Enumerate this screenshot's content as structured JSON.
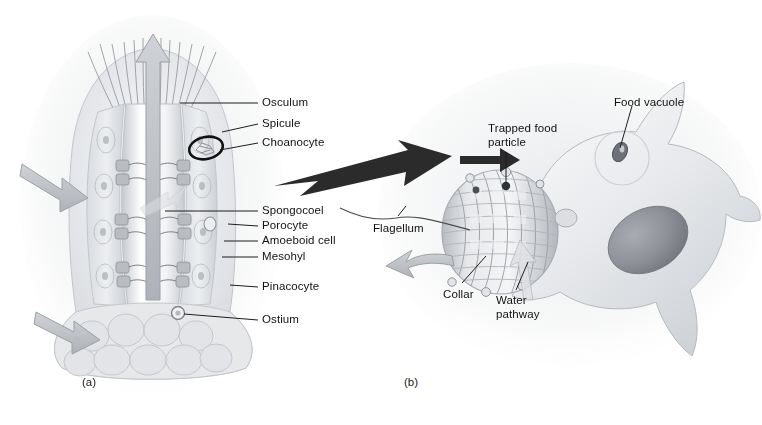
{
  "figure": {
    "background": "#ffffff",
    "ink": "#111111"
  },
  "panel_a": {
    "caption": "(a)",
    "caption_pos": {
      "x": 82,
      "y": 383
    },
    "labels": [
      {
        "id": "osculum",
        "text": "Osculum",
        "x": 262,
        "y": 96,
        "leader": [
          [
            258,
            103
          ],
          [
            180,
            103
          ]
        ]
      },
      {
        "id": "spicule",
        "text": "Spicule",
        "x": 262,
        "y": 117,
        "leader": [
          [
            258,
            124
          ],
          [
            222,
            132
          ]
        ]
      },
      {
        "id": "choanocyte",
        "text": "Choanocyte",
        "x": 262,
        "y": 136,
        "leader": [
          [
            258,
            143
          ],
          [
            220,
            150
          ]
        ]
      },
      {
        "id": "spongocoel",
        "text": "Spongocoel",
        "x": 262,
        "y": 204,
        "leader": [
          [
            258,
            211
          ],
          [
            165,
            211
          ]
        ]
      },
      {
        "id": "porocyte",
        "text": "Porocyte",
        "x": 262,
        "y": 219,
        "leader": [
          [
            258,
            226
          ],
          [
            228,
            224
          ]
        ]
      },
      {
        "id": "amoeboid-cell",
        "text": "Amoeboid cell",
        "x": 262,
        "y": 234,
        "leader": [
          [
            258,
            241
          ],
          [
            224,
            241
          ]
        ]
      },
      {
        "id": "mesohyl",
        "text": "Mesohyl",
        "x": 262,
        "y": 250,
        "leader": [
          [
            258,
            257
          ],
          [
            222,
            257
          ]
        ]
      },
      {
        "id": "pinacocyte",
        "text": "Pinacocyte",
        "x": 262,
        "y": 280,
        "leader": [
          [
            258,
            287
          ],
          [
            230,
            285
          ]
        ]
      },
      {
        "id": "ostium",
        "text": "Ostium",
        "x": 262,
        "y": 313,
        "leader": [
          [
            258,
            320
          ],
          [
            178,
            313
          ]
        ]
      }
    ],
    "highlight_ellipse": {
      "cx": 206,
      "cy": 148,
      "rx": 17,
      "ry": 11,
      "angle": -12,
      "stroke": "#111111"
    },
    "water_arrows": [
      {
        "id": "outflow-osculum",
        "dir": "up",
        "x": 152,
        "y": 60
      },
      {
        "id": "inflow-upper",
        "dir": "right-down",
        "x": 48,
        "y": 185
      },
      {
        "id": "inflow-lower",
        "dir": "right-down",
        "x": 60,
        "y": 330
      }
    ]
  },
  "panel_b": {
    "caption": "(b)",
    "caption_pos": {
      "x": 404,
      "y": 383
    },
    "labels": [
      {
        "id": "trapped-food-particle",
        "text": "Trapped food\nparticle",
        "x": 488,
        "y": 122,
        "leader": [
          [
            506,
            152
          ],
          [
            506,
            186
          ]
        ]
      },
      {
        "id": "food-vacuole",
        "text": "Food vacuole",
        "x": 614,
        "y": 96,
        "leader": [
          [
            630,
            106
          ],
          [
            618,
            151
          ]
        ]
      },
      {
        "id": "flagellum",
        "text": "Flagellum",
        "x": 373,
        "y": 222,
        "leader": [
          [
            398,
            218
          ],
          [
            470,
            230
          ]
        ]
      },
      {
        "id": "collar",
        "text": "Collar",
        "x": 443,
        "y": 288,
        "leader": [
          [
            458,
            285
          ],
          [
            486,
            255
          ]
        ]
      },
      {
        "id": "water-pathway",
        "text": "Water\npathway",
        "x": 496,
        "y": 294,
        "leader": [
          [
            512,
            292
          ],
          [
            528,
            258
          ]
        ]
      }
    ],
    "cell": {
      "nucleus": "dark ellipse",
      "vacuole_ring": "circle"
    },
    "arrows": [
      {
        "id": "intake-arrow-black",
        "dir": "right",
        "x": 470,
        "y": 157
      },
      {
        "id": "exhaust-arrow-gray",
        "dir": "left",
        "x": 412,
        "y": 268
      }
    ]
  },
  "connector": {
    "id": "magnification-arrow",
    "from": {
      "x": 276,
      "y": 172
    },
    "to": {
      "x": 448,
      "y": 160
    },
    "color": "#2b2b2b"
  },
  "colors": {
    "ink": "#111111",
    "line": "#3a3a3a",
    "gray_arrow": "#b9bcc0",
    "gray_arrow_edge": "#9a9ea3",
    "tissue_light": "#e9eaec",
    "tissue_mid": "#d2d5d9",
    "tissue_dark": "#b0b4ba",
    "nucleus": "#8d9096",
    "black_arrow": "#2b2b2b"
  }
}
